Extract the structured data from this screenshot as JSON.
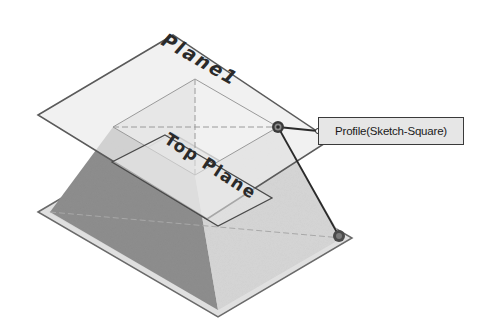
{
  "viewport": {
    "background": "#ffffff",
    "model": "loft-frustum",
    "planes": [
      {
        "id": "plane1",
        "label": "Plane1"
      },
      {
        "id": "top-plane",
        "label": "Top Plane"
      }
    ]
  },
  "callout": {
    "label": "Profile(Sketch-Square)",
    "icon": "connector-dot-icon"
  },
  "handles": [
    {
      "name": "profile-connector-upper",
      "icon": "target-handle-icon"
    },
    {
      "name": "profile-connector-lower",
      "icon": "target-handle-icon"
    }
  ],
  "colors": {
    "plane_fill": "#e2e2e2",
    "plane_edge": "#5a5a5a",
    "dark_face": "#8c8c8c",
    "light_face": "#d4d4d4",
    "text": "#1a1a1a"
  }
}
